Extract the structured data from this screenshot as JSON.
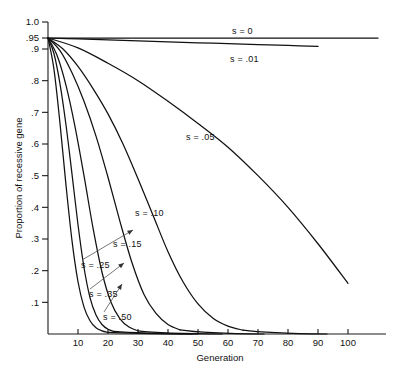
{
  "chart_data": {
    "type": "line",
    "title": "",
    "xlabel": "Generation",
    "ylabel": "Proportion of recessive gene",
    "xlim": [
      0,
      110
    ],
    "ylim": [
      0,
      1.0
    ],
    "grid": false,
    "legend_position": "inline-annotations",
    "xticks": [
      10,
      20,
      30,
      40,
      50,
      60,
      70,
      80,
      90,
      100
    ],
    "yticks": [
      "1.0",
      ".95",
      ".9",
      ".8",
      ".7",
      ".6",
      ".5",
      ".4",
      ".3",
      ".2",
      ".1"
    ],
    "ytick_values": [
      1.0,
      0.95,
      0.9,
      0.8,
      0.7,
      0.6,
      0.5,
      0.4,
      0.3,
      0.2,
      0.1
    ],
    "start_value": 0.95,
    "series": [
      {
        "name": "s = 0",
        "s": 0,
        "label": "s = 0",
        "label_x": 232,
        "label_y": 34,
        "x": [
          0,
          10,
          20,
          30,
          40,
          50,
          60,
          70,
          80,
          90,
          100,
          110
        ],
        "values": [
          0.95,
          0.95,
          0.95,
          0.95,
          0.95,
          0.95,
          0.95,
          0.95,
          0.95,
          0.95,
          0.95,
          0.95
        ]
      },
      {
        "name": "s = .01",
        "s": 0.01,
        "label": "s = .01",
        "label_x": 230,
        "label_y": 62,
        "x": [
          0,
          10,
          20,
          30,
          40,
          50,
          60,
          70,
          80,
          90
        ],
        "values": [
          0.95,
          0.9455,
          0.9411,
          0.9368,
          0.9325,
          0.9283,
          0.9241,
          0.92,
          0.916,
          0.912
        ]
      },
      {
        "name": "s = .05",
        "s": 0.05,
        "label": "s = .05",
        "label_x": 186,
        "label_y": 140,
        "x": [
          0,
          10,
          20,
          30,
          40,
          50,
          60,
          70,
          80,
          90,
          100
        ],
        "values": [
          0.95,
          0.905,
          0.855,
          0.8,
          0.735,
          0.665,
          0.59,
          0.5,
          0.4,
          0.285,
          0.16
        ]
      },
      {
        "name": "s = .10",
        "s": 0.1,
        "label": "s = .10",
        "label_x": 135,
        "label_y": 216,
        "x": [
          0,
          5,
          10,
          15,
          20,
          25,
          30,
          35,
          40,
          45,
          50,
          55,
          60,
          65
        ],
        "values": [
          0.95,
          0.9,
          0.845,
          0.775,
          0.695,
          0.6,
          0.49,
          0.375,
          0.26,
          0.165,
          0.095,
          0.05,
          0.025,
          0.012
        ]
      },
      {
        "name": "s = .15",
        "s": 0.15,
        "label": "s = .15",
        "label_x": 113,
        "label_y": 247,
        "x": [
          0,
          4,
          8,
          12,
          16,
          20,
          24,
          28,
          32,
          36,
          40,
          44
        ],
        "values": [
          0.95,
          0.895,
          0.825,
          0.735,
          0.625,
          0.495,
          0.355,
          0.225,
          0.125,
          0.065,
          0.03,
          0.013
        ]
      },
      {
        "name": "s = .25",
        "s": 0.25,
        "label": "s = .25",
        "label_x": 81,
        "label_y": 268,
        "leader_to_x": 133,
        "leader_to_y": 230,
        "x": [
          0,
          3,
          6,
          9,
          12,
          15,
          18,
          21,
          24,
          27,
          30
        ],
        "values": [
          0.95,
          0.88,
          0.785,
          0.655,
          0.5,
          0.335,
          0.195,
          0.1,
          0.048,
          0.022,
          0.01
        ]
      },
      {
        "name": "s = .35",
        "s": 0.35,
        "label": "s = .35",
        "label_x": 89,
        "label_y": 297,
        "leader_to_x": 124,
        "leader_to_y": 263,
        "x": [
          0,
          2,
          4,
          6,
          8,
          10,
          12,
          14,
          16,
          18,
          20,
          22
        ],
        "values": [
          0.95,
          0.885,
          0.79,
          0.66,
          0.505,
          0.345,
          0.21,
          0.115,
          0.06,
          0.03,
          0.015,
          0.008
        ]
      },
      {
        "name": "s = .50",
        "s": 0.5,
        "label": "s = .50",
        "label_x": 103,
        "label_y": 320,
        "leader_to_x": 122,
        "leader_to_y": 284,
        "x": [
          0,
          2,
          4,
          6,
          8,
          10,
          12,
          14,
          16,
          18,
          20
        ],
        "values": [
          0.95,
          0.835,
          0.665,
          0.47,
          0.295,
          0.165,
          0.085,
          0.042,
          0.02,
          0.01,
          0.005
        ]
      }
    ]
  },
  "axes": {
    "x_title": "Generation",
    "y_title": "Proportion of recessive gene"
  },
  "colors": {
    "curve": "#111111",
    "axis": "#1a1a1a",
    "leader": "#555555",
    "background": "#ffffff"
  }
}
